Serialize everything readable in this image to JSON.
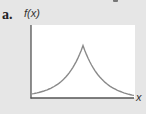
{
  "figure": {
    "panel_label": "a.",
    "y_axis_label": "f(x)",
    "x_axis_label": "x"
  },
  "colors": {
    "background": "#e6e6e6",
    "plot_area": "#ffffff",
    "axis": "#555555",
    "curve": "#8a8a8a"
  },
  "chart_data": {
    "type": "line",
    "title": "",
    "panel": "a.",
    "xlabel": "x",
    "ylabel": "f(x)",
    "grid": false,
    "ticks": false,
    "series": [
      {
        "name": "f(x)",
        "x": [
          0,
          0.1,
          0.2,
          0.3,
          0.4,
          0.45,
          0.5,
          0.55,
          0.6,
          0.7,
          0.8,
          0.9,
          1.0
        ],
        "y": [
          0.08,
          0.12,
          0.19,
          0.3,
          0.48,
          0.62,
          1.0,
          0.62,
          0.48,
          0.3,
          0.19,
          0.12,
          0.03
        ]
      }
    ],
    "xlim": [
      0,
      1
    ],
    "ylim": [
      0,
      1.4
    ]
  }
}
